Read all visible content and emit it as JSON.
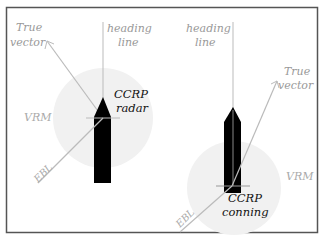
{
  "diagram": {
    "frame_color": "#555555",
    "circle_color": "#f1f1f1",
    "line_color": "#b8b8b8",
    "ship_color": "#000000",
    "label_color": "#999999",
    "ccrp_label_color": "#111111",
    "left": {
      "true_vector_line1": "True",
      "true_vector_line2": "vector",
      "heading_line1": "heading",
      "heading_line2": "line",
      "ccrp_line1": "CCRP",
      "ccrp_line2": "radar",
      "vrm": "VRM",
      "ebl": "EBL"
    },
    "right": {
      "heading_line1": "heading",
      "heading_line2": "line",
      "true_vector_line1": "True",
      "true_vector_line2": "vector",
      "vrm": "VRM",
      "ccrp_line1": "CCRP",
      "ccrp_line2": "conning",
      "ebl": "EBL"
    }
  }
}
